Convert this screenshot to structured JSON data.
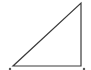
{
  "diagram": {
    "type": "right-triangle",
    "stroke_color": "#3a3a3a",
    "background": "#ffffff",
    "vertices": [
      {
        "name": "bottom-left",
        "x": 13,
        "y": 66
      },
      {
        "name": "bottom-right",
        "x": 81,
        "y": 66
      },
      {
        "name": "top-right",
        "x": 81,
        "y": 3
      }
    ],
    "right_angle_at": "bottom-right"
  }
}
